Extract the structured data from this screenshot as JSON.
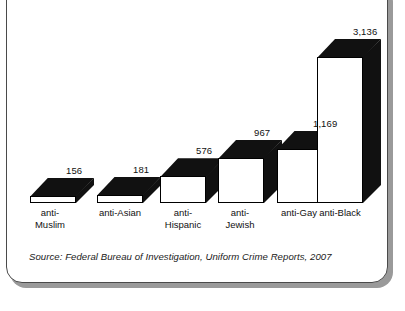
{
  "chart_data": {
    "type": "bar",
    "title": "",
    "subtitle": "",
    "xlabel": "",
    "ylabel": "",
    "categories": [
      "anti-\nMuslim",
      "anti-Asian",
      "anti-\nHispanic",
      "anti-\nJewish",
      "anti-Gay",
      "anti-Black"
    ],
    "values": [
      156,
      181,
      576,
      967,
      1169,
      3136
    ],
    "value_labels": [
      "156",
      "181",
      "576",
      "967",
      "1,169",
      "3,136"
    ],
    "ylim": [
      0,
      3136
    ],
    "grid": false,
    "legend": "none",
    "style": "3d-extruded-bars",
    "colors": {
      "bar_front": "#ffffff",
      "bar_extrude": "#111111",
      "outline": "#000000",
      "text": "#111111",
      "card_background": "#ffffff",
      "card_border": "#4a4a4a",
      "card_shadow": "#9a9a9a"
    },
    "annotations": {
      "source": "Source: Federal Bureau of Investigation, Uniform Crime Reports, 2007"
    }
  }
}
